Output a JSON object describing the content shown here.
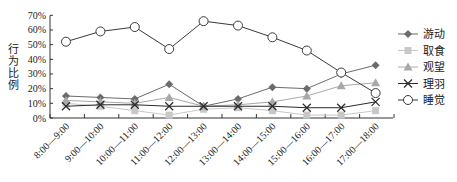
{
  "chart_data": {
    "type": "line",
    "title": "",
    "xlabel": "",
    "ylabel": "行为比例",
    "ylim": [
      0,
      70
    ],
    "yticks": [
      "0%",
      "10%",
      "20%",
      "30%",
      "40%",
      "50%",
      "60%",
      "70%"
    ],
    "grid": false,
    "legend_position": "right",
    "categories": [
      "8:00—9:00",
      "9:00—10:00",
      "10:00—11:00",
      "11:00—12:00",
      "12:00—13:00",
      "13:00—14:00",
      "14:00—15:00",
      "15:00—16:00",
      "16:00—17:00",
      "17:00—18:00"
    ],
    "series": [
      {
        "name": "游动",
        "marker": "diamond",
        "color": "#6b6b6b",
        "values": [
          15,
          14,
          13,
          23,
          8,
          13,
          21,
          20,
          30,
          36
        ]
      },
      {
        "name": "取食",
        "marker": "square",
        "color": "#c8c8c8",
        "values": [
          10,
          8,
          5,
          2,
          6,
          7,
          5,
          2,
          2,
          5
        ]
      },
      {
        "name": "观望",
        "marker": "triangle",
        "color": "#a8a8a8",
        "values": [
          12,
          11,
          10,
          14,
          8,
          9,
          11,
          15,
          22,
          24
        ]
      },
      {
        "name": "理羽",
        "marker": "x",
        "color": "#2a2a2a",
        "values": [
          8,
          9,
          9,
          8,
          8,
          8,
          8,
          7,
          7,
          11
        ]
      },
      {
        "name": "睡觉",
        "marker": "circle",
        "color": "#3a3a3a",
        "values": [
          52,
          59,
          62,
          47,
          66,
          63,
          55,
          46,
          31,
          17
        ]
      }
    ]
  }
}
